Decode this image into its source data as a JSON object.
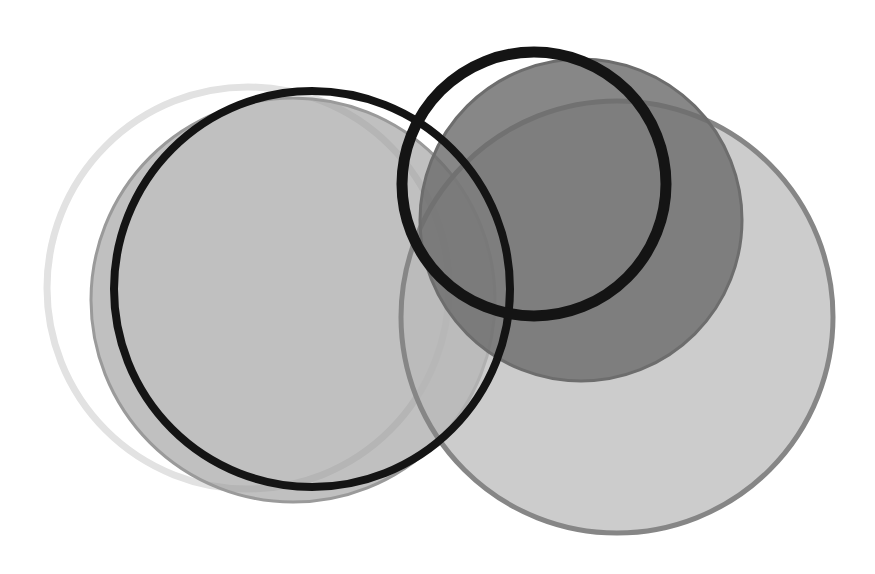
{
  "figure": {
    "title": "",
    "background_color": "#ffffff",
    "width": 875,
    "height": 574,
    "kind": "overlapping-circles-venn-diagram"
  },
  "chart_data": {
    "type": "scatter",
    "title": "",
    "subtitle": "",
    "xlabel": "",
    "ylabel": "",
    "xlim": [
      0,
      875
    ],
    "ylim": [
      0,
      574
    ],
    "grid": false,
    "legend": "none",
    "shapes": [
      {
        "id": "shape-1",
        "name": "light-ring-outer-left",
        "role": "outline-circle",
        "cx": 248,
        "cy": 288,
        "r": 201,
        "fill": "none",
        "fill_opacity": 0,
        "stroke": "#e2e2e2",
        "stroke_width": 7
      },
      {
        "id": "shape-2",
        "name": "grey-disc-left",
        "role": "filled-circle",
        "cx": 293,
        "cy": 300,
        "r": 202,
        "fill": "#9a9a9a",
        "fill_opacity": 0.62,
        "stroke": "#9a9a9a",
        "stroke_width": 3
      },
      {
        "id": "shape-3",
        "name": "light-grey-disc-right",
        "role": "filled-circle",
        "cx": 617,
        "cy": 317,
        "r": 216,
        "fill": "#b9b9b9",
        "fill_opacity": 0.72,
        "stroke": "#868686",
        "stroke_width": 5
      },
      {
        "id": "shape-4",
        "name": "dark-grey-disc-upper-right",
        "role": "filled-circle",
        "cx": 581,
        "cy": 220,
        "r": 161,
        "fill": "#6d6d6d",
        "fill_opacity": 0.82,
        "stroke": "#6d6d6d",
        "stroke_width": 3
      },
      {
        "id": "shape-5",
        "name": "black-ring-left",
        "role": "outline-circle",
        "cx": 312,
        "cy": 289,
        "r": 198,
        "fill": "none",
        "fill_opacity": 0,
        "stroke": "#141414",
        "stroke_width": 8
      },
      {
        "id": "shape-6",
        "name": "black-ring-right",
        "role": "outline-circle",
        "cx": 534,
        "cy": 184,
        "r": 132,
        "fill": "none",
        "fill_opacity": 0,
        "stroke": "#141414",
        "stroke_width": 11
      }
    ],
    "palette": {
      "background": "#ffffff",
      "black_stroke": "#141414",
      "light_ring_stroke": "#e2e2e2",
      "grey_disc_left": "#9a9a9a",
      "light_grey_disc_right": "#b9b9b9",
      "light_grey_disc_right_edge": "#868686",
      "dark_grey_disc": "#6d6d6d"
    }
  }
}
